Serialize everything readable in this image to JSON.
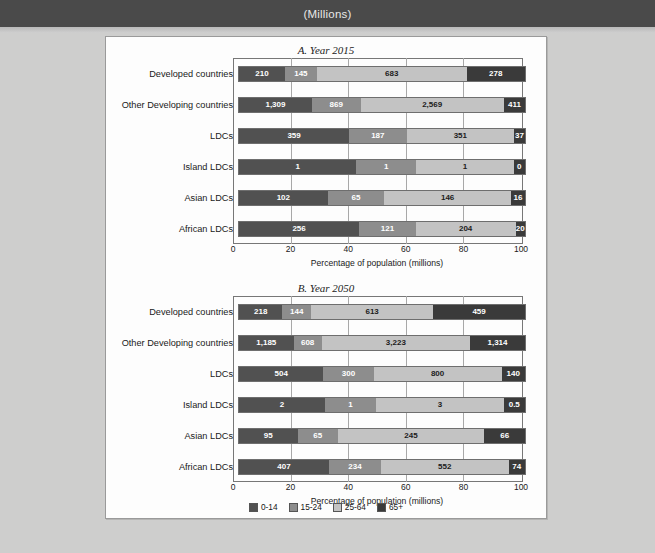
{
  "header": {
    "title": "(Millions)"
  },
  "legend": {
    "items": [
      {
        "label": "0-14",
        "color": "#515151"
      },
      {
        "label": "15-24",
        "color": "#8d8d8d"
      },
      {
        "label": "25-64",
        "color": "#c3c3c3"
      },
      {
        "label": "65+",
        "color": "#3a3a3a"
      }
    ]
  },
  "chart_data": [
    {
      "type": "bar",
      "orientation": "horizontal",
      "stacked": true,
      "normalized": true,
      "title": "A. Year 2015",
      "xlabel": "Percentage of population (millions)",
      "ylabel": "",
      "xlim": [
        0,
        100
      ],
      "xticks": [
        0,
        20,
        40,
        60,
        80,
        100
      ],
      "grid": true,
      "legend_position": "bottom",
      "categories": [
        "Developed countries",
        "Other Developing countries",
        "LDCs",
        "Island LDCs",
        "Asian LDCs",
        "African LDCs"
      ],
      "series": [
        {
          "name": "0-14",
          "values": [
            210,
            1309,
            359,
            1,
            102,
            256
          ]
        },
        {
          "name": "15-24",
          "values": [
            145,
            869,
            187,
            1,
            65,
            121
          ]
        },
        {
          "name": "25-64",
          "values": [
            683,
            2569,
            351,
            1,
            146,
            204
          ]
        },
        {
          "name": "65+",
          "values": [
            278,
            411,
            37,
            0,
            16,
            20
          ]
        }
      ],
      "labels": [
        [
          "210",
          "145",
          "683",
          "278"
        ],
        [
          "1,309",
          "869",
          "2,569",
          "411"
        ],
        [
          "359",
          "187",
          "351",
          "37"
        ],
        [
          "1",
          "1",
          "1",
          "0"
        ],
        [
          "102",
          "65",
          "146",
          "16"
        ],
        [
          "256",
          "121",
          "204",
          "20"
        ]
      ],
      "percent_widths": [
        [
          16.1,
          11.1,
          52.4,
          20.4
        ],
        [
          25.5,
          17.0,
          50.1,
          7.4
        ],
        [
          38.5,
          20.1,
          37.6,
          3.8
        ],
        [
          41.0,
          21.0,
          34.0,
          4.0
        ],
        [
          31.0,
          19.8,
          44.3,
          4.9
        ],
        [
          42.0,
          19.8,
          34.9,
          3.3
        ]
      ]
    },
    {
      "type": "bar",
      "orientation": "horizontal",
      "stacked": true,
      "normalized": true,
      "title": "B. Year 2050",
      "xlabel": "Percentage of population (millions)",
      "ylabel": "",
      "xlim": [
        0,
        100
      ],
      "xticks": [
        0,
        20,
        40,
        60,
        80,
        100
      ],
      "grid": true,
      "legend_position": "bottom",
      "categories": [
        "Developed countries",
        "Other Developing countries",
        "LDCs",
        "Island LDCs",
        "Asian LDCs",
        "African LDCs"
      ],
      "series": [
        {
          "name": "0-14",
          "values": [
            218,
            1185,
            504,
            2,
            95,
            407
          ]
        },
        {
          "name": "15-24",
          "values": [
            144,
            608,
            300,
            1,
            65,
            234
          ]
        },
        {
          "name": "25-64",
          "values": [
            613,
            3223,
            800,
            3,
            245,
            552
          ]
        },
        {
          "name": "65+",
          "values": [
            459,
            1314,
            140,
            0.5,
            66,
            74
          ]
        }
      ],
      "labels": [
        [
          "218",
          "144",
          "613",
          "459"
        ],
        [
          "1,185",
          "608",
          "3,223",
          "1,314"
        ],
        [
          "504",
          "300",
          "800",
          "140"
        ],
        [
          "2",
          "1",
          "3",
          "0.5"
        ],
        [
          "95",
          "65",
          "245",
          "66"
        ],
        [
          "407",
          "234",
          "552",
          "74"
        ]
      ],
      "percent_widths": [
        [
          15.2,
          10.0,
          42.7,
          32.1
        ],
        [
          19.1,
          9.8,
          51.9,
          19.2
        ],
        [
          29.5,
          17.6,
          44.7,
          8.2
        ],
        [
          30.0,
          18.0,
          44.5,
          7.5
        ],
        [
          20.5,
          14.0,
          51.3,
          14.2
        ],
        [
          31.5,
          18.1,
          44.7,
          5.7
        ]
      ]
    }
  ]
}
